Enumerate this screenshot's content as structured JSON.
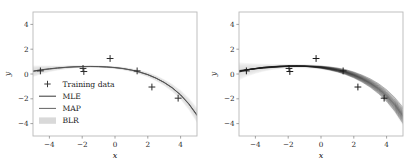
{
  "figure": {
    "background": "#ffffff",
    "panel_count": 2
  },
  "chart_data": [
    {
      "id": "left-panel",
      "type": "line",
      "title": "",
      "xlabel": "x",
      "ylabel": "y",
      "xlim": [
        -5,
        5
      ],
      "ylim": [
        -5,
        5
      ],
      "xticks": [
        -4,
        -2,
        0,
        2,
        4
      ],
      "xticklabels": [
        "−4",
        "−2",
        "0",
        "2",
        "4"
      ],
      "yticks": [
        -4,
        -2,
        0,
        2,
        4
      ],
      "yticklabels": [
        "−4",
        "−2",
        "0",
        "2",
        "4"
      ],
      "grid": false,
      "legend_position": "lower left",
      "legend": [
        {
          "label": "Training data",
          "handle": "plus-marker",
          "color": "#3a3a3a"
        },
        {
          "label": "MLE",
          "handle": "line",
          "color": "#2b2b2b"
        },
        {
          "label": "MAP",
          "handle": "line",
          "color": "#5a5a5a"
        },
        {
          "label": "BLR",
          "handle": "band",
          "color": "#d9d9d9"
        }
      ],
      "scatter": {
        "name": "Training data",
        "marker": "+",
        "color": "#2b2b2b",
        "x": [
          -4.55,
          -1.95,
          -1.9,
          -0.3,
          1.35,
          2.25,
          3.85
        ],
        "y": [
          0.25,
          0.45,
          0.2,
          1.25,
          0.25,
          -1.05,
          -1.95
        ]
      },
      "series": [
        {
          "name": "MLE",
          "color": "#2b2b2b",
          "x": [
            -5,
            -4.5,
            -4,
            -3.5,
            -3,
            -2.5,
            -2,
            -1.5,
            -1,
            -0.5,
            0,
            0.5,
            1,
            1.5,
            2,
            2.5,
            3,
            3.5,
            4,
            4.5,
            5
          ],
          "y": [
            0.24,
            0.34,
            0.42,
            0.49,
            0.54,
            0.58,
            0.6,
            0.61,
            0.6,
            0.57,
            0.52,
            0.44,
            0.32,
            0.16,
            -0.05,
            -0.33,
            -0.68,
            -1.12,
            -1.68,
            -2.4,
            -3.3
          ]
        },
        {
          "name": "MAP",
          "color": "#5a5a5a",
          "x": [
            -5,
            -4.5,
            -4,
            -3.5,
            -3,
            -2.5,
            -2,
            -1.5,
            -1,
            -0.5,
            0,
            0.5,
            1,
            1.5,
            2,
            2.5,
            3,
            3.5,
            4,
            4.5,
            5
          ],
          "y": [
            0.2,
            0.31,
            0.4,
            0.47,
            0.53,
            0.57,
            0.59,
            0.6,
            0.59,
            0.56,
            0.51,
            0.43,
            0.31,
            0.15,
            -0.06,
            -0.34,
            -0.69,
            -1.13,
            -1.7,
            -2.43,
            -3.35
          ]
        }
      ],
      "band": {
        "name": "BLR",
        "color": "#d9d9d9",
        "x": [
          -5,
          -4.5,
          -4,
          -3.5,
          -3,
          -2.5,
          -2,
          -1.5,
          -1,
          -0.5,
          0,
          0.5,
          1,
          1.5,
          2,
          2.5,
          3,
          3.5,
          4,
          4.5,
          5
        ],
        "lower": [
          -0.25,
          -0.02,
          0.16,
          0.29,
          0.39,
          0.46,
          0.5,
          0.52,
          0.51,
          0.47,
          0.4,
          0.3,
          0.16,
          -0.02,
          -0.26,
          -0.57,
          -0.96,
          -1.45,
          -2.08,
          -2.9,
          -3.95
        ],
        "upper": [
          0.68,
          0.68,
          0.68,
          0.67,
          0.68,
          0.7,
          0.7,
          0.7,
          0.69,
          0.66,
          0.63,
          0.57,
          0.47,
          0.33,
          0.15,
          -0.1,
          -0.42,
          -0.8,
          -1.29,
          -1.92,
          -2.7
        ]
      }
    },
    {
      "id": "right-panel",
      "type": "line",
      "title": "",
      "xlabel": "x",
      "ylabel": "y",
      "xlim": [
        -5,
        5
      ],
      "ylim": [
        -5,
        5
      ],
      "xticks": [
        -4,
        -2,
        0,
        2,
        4
      ],
      "xticklabels": [
        "−4",
        "−2",
        "0",
        "2",
        "4"
      ],
      "yticks": [
        -4,
        -2,
        0,
        2,
        4
      ],
      "yticklabels": [
        "−4",
        "−2",
        "0",
        "2",
        "4"
      ],
      "grid": false,
      "legend_position": "none",
      "legend": [],
      "scatter": {
        "name": "Training data",
        "marker": "+",
        "color": "#1a1a1a",
        "x": [
          -4.55,
          -1.95,
          -1.9,
          -0.3,
          1.35,
          2.25,
          3.85
        ],
        "y": [
          0.25,
          0.45,
          0.2,
          1.25,
          0.25,
          -1.05,
          -1.95
        ]
      },
      "posterior_samples": {
        "name": "Posterior function samples",
        "color": "#1a1a1a",
        "count": 18,
        "x": [
          -5,
          -4.5,
          -4,
          -3.5,
          -3,
          -2.5,
          -2,
          -1.5,
          -1,
          -0.5,
          0,
          0.5,
          1,
          1.5,
          2,
          2.5,
          3,
          3.5,
          4,
          4.5,
          5
        ],
        "offsets": [
          -0.42,
          -0.34,
          -0.28,
          -0.22,
          -0.17,
          -0.12,
          -0.08,
          -0.04,
          -0.01,
          0.02,
          0.05,
          0.09,
          0.13,
          0.18,
          0.24,
          0.3,
          0.37,
          0.46
        ],
        "slopes": [
          -0.09,
          -0.075,
          -0.06,
          -0.05,
          -0.04,
          -0.03,
          -0.02,
          -0.012,
          -0.005,
          0.003,
          0.012,
          0.02,
          0.03,
          0.04,
          0.05,
          0.062,
          0.078,
          0.095
        ]
      },
      "band": {
        "name": "BLR",
        "color": "#dedede",
        "x": [
          -5,
          -4.5,
          -4,
          -3.5,
          -3,
          -2.5,
          -2,
          -1.5,
          -1,
          -0.5,
          0,
          0.5,
          1,
          1.5,
          2,
          2.5,
          3,
          3.5,
          4,
          4.5,
          5
        ],
        "lower": [
          -0.5,
          -0.2,
          0.02,
          0.2,
          0.32,
          0.41,
          0.46,
          0.48,
          0.47,
          0.43,
          0.36,
          0.25,
          0.1,
          -0.1,
          -0.36,
          -0.7,
          -1.12,
          -1.65,
          -2.3,
          -3.15,
          -4.2
        ],
        "upper": [
          0.92,
          0.88,
          0.84,
          0.82,
          0.8,
          0.8,
          0.8,
          0.8,
          0.79,
          0.76,
          0.72,
          0.64,
          0.54,
          0.4,
          0.2,
          -0.05,
          -0.35,
          -0.72,
          -1.2,
          -1.8,
          -2.55
        ]
      }
    }
  ]
}
